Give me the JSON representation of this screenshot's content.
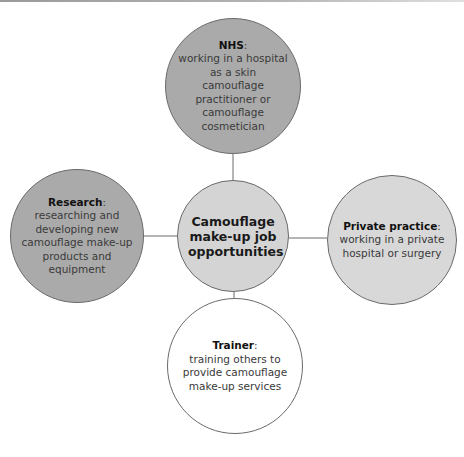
{
  "colors": {
    "dark_node": "#aaaaaa",
    "center_node": "#d4d4d4",
    "light_node": "#d8d8d8",
    "white_node": "#ffffff",
    "line": "#6a6a6a"
  },
  "center": {
    "label": "Camouflage make-up job opportunities"
  },
  "nodes": [
    {
      "id": "nhs",
      "title": "NHS",
      "suffix": ":",
      "description": "working in a hospital as a skin camouflage practitioner or camouflage cosmetician"
    },
    {
      "id": "research",
      "title": "Research",
      "suffix": ":",
      "description": "researching and developing new camouflage make-up products and equipment"
    },
    {
      "id": "private",
      "title": "Private practice",
      "suffix": ":",
      "description": "working in a private hospital or surgery"
    },
    {
      "id": "trainer",
      "title": "Trainer",
      "suffix": ":",
      "description": "training others to provide camouflage make-up services"
    }
  ]
}
